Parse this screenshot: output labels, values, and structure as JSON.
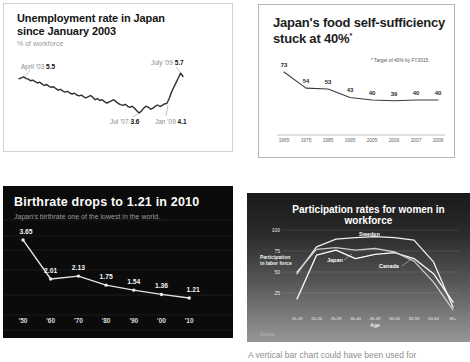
{
  "caption": "A vertical bar chart could have been used for",
  "chart_data": [
    {
      "id": "unemployment",
      "type": "line",
      "title_line1": "Unemployment rate in Japan",
      "title_line2": "since January 2003",
      "ylabel": "% of workforce",
      "line_color": "#2e2e2e",
      "background": "#ffffff",
      "ylim": [
        3.4,
        6.0
      ],
      "annotations": {
        "start": {
          "date": "April '03",
          "value": "5.5"
        },
        "low": {
          "date": "Jul '07",
          "value": "3.6"
        },
        "rise": {
          "date": "Jan '09",
          "value": "4.1"
        },
        "peak": {
          "date": "July '09",
          "value": "5.7"
        }
      },
      "values": [
        5.4,
        5.45,
        5.5,
        5.42,
        5.38,
        5.3,
        5.33,
        5.25,
        5.18,
        5.22,
        5.12,
        5.05,
        5.1,
        5.0,
        4.95,
        4.98,
        4.88,
        4.8,
        4.85,
        4.75,
        4.7,
        4.74,
        4.65,
        4.6,
        4.64,
        4.55,
        4.5,
        4.54,
        4.45,
        4.4,
        4.46,
        4.52,
        4.42,
        4.3,
        4.36,
        4.26,
        4.3,
        4.2,
        4.12,
        4.18,
        4.24,
        4.3,
        4.2,
        4.1,
        4.04,
        4.0,
        4.06,
        3.95,
        3.9,
        3.96,
        3.85,
        3.72,
        3.6,
        3.7,
        3.86,
        3.96,
        3.9,
        3.8,
        3.86,
        3.96,
        4.02,
        3.94,
        4.0,
        4.08,
        4.1,
        4.35,
        4.7,
        4.95,
        5.2,
        5.45,
        5.7,
        5.52
      ]
    },
    {
      "id": "food_self_sufficiency",
      "type": "line",
      "title_line1": "Japan's food self-sufficiency",
      "title_line2": "stuck at 40%",
      "title_asterisk": "*",
      "footnote": "* Target of 40% by FY2015.",
      "line_color": "#3c3c3c",
      "background": "#ffffff",
      "ylim": [
        0,
        100
      ],
      "categories": [
        "1965",
        "1975",
        "1985",
        "1995",
        "2005",
        "2006",
        "2007",
        "2008"
      ],
      "values": [
        73,
        54,
        53,
        43,
        40,
        39,
        40,
        40
      ]
    },
    {
      "id": "birthrate",
      "type": "line",
      "title": "Birthrate drops to 1.21 in 2010",
      "subtitle": "Japan's birthrate one of the lowest in the world.",
      "line_color": "#e2e2e2",
      "background": "#0b0b0b",
      "ylim": [
        1.0,
        4.0
      ],
      "categories": [
        "'50",
        "'60",
        "'70",
        "'80",
        "'90",
        "'00",
        "'10"
      ],
      "values": [
        3.65,
        2.01,
        2.13,
        1.75,
        1.54,
        1.36,
        1.21
      ]
    },
    {
      "id": "women_workforce_participation",
      "type": "line",
      "title": "Participation rates for women in workforce",
      "ylabel_line1": "Participation",
      "ylabel_line2": "in labor force",
      "xlabel": "Age",
      "source_note": "Source:",
      "background_top": "#191919",
      "background_bottom": "#979797",
      "ylim": [
        0,
        100
      ],
      "yticks": [
        "100",
        "75",
        "50",
        "25"
      ],
      "categories": [
        "15-19",
        "20-24",
        "25-29",
        "30-44",
        "45-49",
        "50-54",
        "55-59",
        "60-64",
        "65+"
      ],
      "series": [
        {
          "name": "Sweden",
          "color": "#f0f0f0",
          "values": [
            48,
            80,
            89,
            91,
            92,
            91,
            88,
            62,
            8
          ]
        },
        {
          "name": "Japan",
          "color": "#ffffff",
          "values": [
            18,
            70,
            76,
            66,
            71,
            73,
            66,
            48,
            14
          ]
        },
        {
          "name": "Canada",
          "color": "#cccccc",
          "values": [
            50,
            77,
            79,
            76,
            78,
            74,
            63,
            38,
            5
          ]
        }
      ]
    }
  ]
}
